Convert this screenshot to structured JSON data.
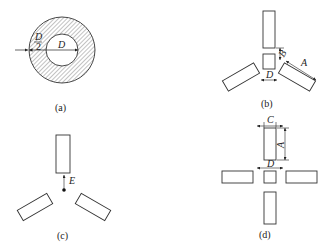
{
  "figure": {
    "panels": [
      {
        "id": "a",
        "caption": "(a)",
        "description": "Annular ring with hatched cross-section; inner diameter D, ring width D/2",
        "labels": {
          "inner_diameter": "D",
          "ring_width_num": "D",
          "ring_width_den": "2"
        }
      },
      {
        "id": "b",
        "caption": "(b)",
        "description": "Three electrodes at 120° around a central square; dimensions A, B, D",
        "labels": {
          "length": "A",
          "gap": "B",
          "square": "D"
        }
      },
      {
        "id": "c",
        "caption": "(c)",
        "description": "Three electrodes at 120° around a point; distance E from point to electrode",
        "labels": {
          "distance": "E"
        }
      },
      {
        "id": "d",
        "caption": "(d)",
        "description": "Four electrodes in a cross around a central square; dimensions A, C, D",
        "labels": {
          "length": "A",
          "width": "C",
          "square": "D"
        }
      }
    ]
  },
  "colors": {
    "stroke": "#333333",
    "hatch": "#555555",
    "background": "#ffffff"
  }
}
